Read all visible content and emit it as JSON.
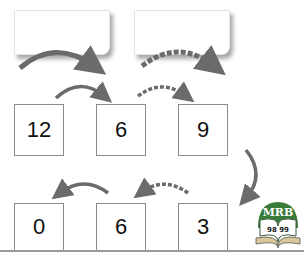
{
  "diagram": {
    "operation_boxes": [
      {
        "id": "op-box-1",
        "value": "",
        "arrow_style": "solid"
      },
      {
        "id": "op-box-2",
        "value": "",
        "arrow_style": "dashed"
      }
    ],
    "row1": [
      {
        "value": "12"
      },
      {
        "value": "6"
      },
      {
        "value": "9"
      }
    ],
    "row2": [
      {
        "value": "0"
      },
      {
        "value": "6"
      },
      {
        "value": "3"
      }
    ],
    "arrows": [
      {
        "from": "12",
        "to": "6",
        "style": "solid",
        "direction": "right"
      },
      {
        "from": "6",
        "to": "9",
        "style": "dashed",
        "direction": "right"
      },
      {
        "from": "9",
        "to": "3",
        "style": "solid",
        "direction": "down"
      },
      {
        "from": "3",
        "to": "6",
        "style": "dashed",
        "direction": "left"
      },
      {
        "from": "6",
        "to": "0",
        "style": "solid",
        "direction": "left"
      }
    ],
    "colors": {
      "arrow": "#6b6b6b",
      "box_border": "#8a8a8a",
      "logo_green": "#3a7a3a"
    }
  },
  "logo": {
    "top_text": "MRB",
    "bottom_text": "98 99"
  }
}
